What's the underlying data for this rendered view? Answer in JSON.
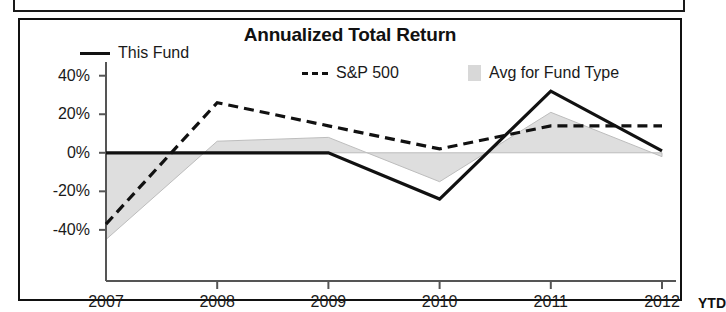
{
  "panel": {
    "title": "Annualized Total Return"
  },
  "legend": {
    "position": "top",
    "items": [
      {
        "label": "This Fund",
        "marker": "solid-line-swatch",
        "color": "#111111"
      },
      {
        "label": "S&P 500",
        "marker": "dashed-line-swatch",
        "color": "#111111"
      },
      {
        "label": "Avg for Fund Type",
        "marker": "gray-area-swatch",
        "color": "#d8d8d8"
      }
    ]
  },
  "axis": {
    "y_ticks": [
      "40%",
      "20%",
      "0%",
      "-20%",
      "-40%"
    ],
    "x_ticks": [
      "2007",
      "2008",
      "2009",
      "2010",
      "2011",
      "2012"
    ],
    "x_suffix": "YTD"
  },
  "chart_data": {
    "type": "line",
    "title": "Annualized Total Return",
    "xlabel": "",
    "ylabel": "",
    "categories": [
      "2007",
      "2008",
      "2009",
      "2010",
      "2011",
      "2012 YTD"
    ],
    "ylim": [
      -52,
      44
    ],
    "ytick_values": [
      40,
      20,
      0,
      -20,
      -40
    ],
    "grid": false,
    "legend_position": "top",
    "series": [
      {
        "name": "This Fund",
        "style": "solid",
        "color": "#111111",
        "values": [
          0,
          0,
          0,
          -24,
          32,
          1
        ]
      },
      {
        "name": "S&P 500",
        "style": "dashed",
        "color": "#111111",
        "values": [
          -37,
          26,
          14,
          2,
          14,
          14
        ]
      },
      {
        "name": "Avg for Fund Type",
        "style": "area",
        "color": "#d8d8d8",
        "values": [
          -45,
          6,
          8,
          -15,
          21,
          -2
        ]
      }
    ]
  }
}
